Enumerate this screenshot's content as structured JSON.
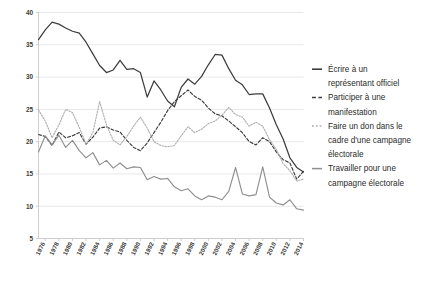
{
  "chart_data": {
    "type": "line",
    "title": "",
    "subtitle": "",
    "xlabel": "",
    "ylabel": "",
    "ylim": [
      5,
      40
    ],
    "xlim": [
      1975,
      2015
    ],
    "grid": true,
    "legend_position": "right",
    "yticks": [
      5,
      10,
      15,
      20,
      25,
      30,
      35,
      40
    ],
    "ytick_labels": [
      "5",
      "10",
      "15",
      "20",
      "25",
      "30",
      "35",
      "40"
    ],
    "x": [
      1975,
      1976,
      1977,
      1978,
      1979,
      1980,
      1981,
      1982,
      1983,
      1984,
      1985,
      1986,
      1987,
      1988,
      1989,
      1990,
      1991,
      1992,
      1993,
      1994,
      1995,
      1996,
      1997,
      1998,
      1999,
      2000,
      2001,
      2002,
      2003,
      2004,
      2005,
      2006,
      2007,
      2008,
      2009,
      2010,
      2011,
      2012,
      2013,
      2014
    ],
    "xtick_labels": [
      "1976",
      "1978",
      "1980",
      "1982",
      "1984",
      "1986",
      "1988",
      "1990",
      "1992",
      "1994",
      "1996",
      "1998",
      "2000",
      "2002",
      "2004",
      "2006",
      "2008",
      "2010",
      "2012",
      "2014"
    ],
    "series": [
      {
        "name": "Écrire à un représentant officiel",
        "style": "solid",
        "color": "#3d3d3d",
        "width": 1.25,
        "values": [
          35.8,
          37.3,
          38.5,
          38.2,
          37.6,
          37.1,
          36.8,
          35.4,
          33.6,
          31.8,
          30.7,
          31.1,
          32.6,
          31.2,
          31.3,
          30.7,
          26.9,
          29.4,
          28.0,
          26.3,
          25.4,
          28.4,
          29.7,
          28.9,
          30.1,
          31.9,
          33.5,
          33.4,
          31.3,
          29.5,
          28.8,
          27.3,
          27.4,
          27.4,
          25.2,
          22.6,
          20.4,
          17.5,
          16.0,
          15.3
        ]
      },
      {
        "name": "Participer à une manifestation",
        "style": "dashed",
        "color": "#3d3d3d",
        "width": 1.15,
        "values": [
          21.1,
          20.8,
          19.4,
          21.5,
          20.6,
          20.9,
          21.4,
          19.6,
          20.7,
          22.1,
          22.3,
          21.8,
          21.5,
          20.2,
          19.1,
          18.6,
          19.8,
          21.4,
          23.0,
          24.8,
          26.2,
          27.1,
          28.0,
          27.0,
          26.4,
          25.2,
          24.3,
          24.0,
          23.2,
          22.3,
          21.4,
          20.0,
          19.5,
          20.6,
          20.0,
          18.4,
          17.2,
          16.7,
          14.2,
          15.4
        ]
      },
      {
        "name": "Faire un don dans le cadre d'une campagne électorale",
        "style": "dotted",
        "color": "#b0b0b2",
        "width": 1.15,
        "values": [
          24.9,
          23.2,
          20.6,
          22.6,
          25.0,
          24.5,
          22.2,
          19.6,
          21.4,
          26.2,
          22.6,
          20.2,
          19.5,
          20.8,
          22.4,
          23.8,
          22.1,
          20.0,
          19.4,
          19.2,
          19.4,
          20.9,
          22.3,
          21.4,
          21.9,
          22.8,
          23.2,
          24.1,
          25.3,
          24.2,
          23.8,
          22.4,
          23.0,
          22.4,
          20.3,
          18.8,
          16.6,
          15.5,
          13.9,
          14.2
        ]
      },
      {
        "name": "Travailler pour une campagne électorale",
        "style": "solid",
        "color": "#8f8f91",
        "width": 1.15,
        "values": [
          18.4,
          20.9,
          19.5,
          21.0,
          19.1,
          20.2,
          18.6,
          17.5,
          18.3,
          16.4,
          17.1,
          15.9,
          16.7,
          15.8,
          16.1,
          16.0,
          14.1,
          14.6,
          14.2,
          14.3,
          13.0,
          12.4,
          12.7,
          11.6,
          11.0,
          11.6,
          11.4,
          11.0,
          12.3,
          16.0,
          11.9,
          11.6,
          11.8,
          16.1,
          11.4,
          10.5,
          10.2,
          11.0,
          9.6,
          9.4
        ]
      }
    ]
  },
  "legend": {
    "items": [
      {
        "label_line1": "Écrire à un",
        "label_line2": "représentant officiel",
        "marker": "solid-dark-line-icon"
      },
      {
        "label_line1": "Participer à une",
        "label_line2": "manifestation",
        "marker": "dashed-dark-line-icon"
      },
      {
        "label_line1": "Faire un don dans le",
        "label_line2": "cadre d'une campagne",
        "label_line3": "électorale",
        "marker": "dotted-gray-line-icon"
      },
      {
        "label_line1": "Travailler pour une",
        "label_line2": "campagne électorale",
        "marker": "solid-gray-line-icon"
      }
    ]
  }
}
